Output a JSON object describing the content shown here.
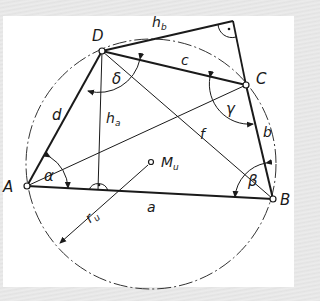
{
  "figure": {
    "colors": {
      "line": "#1a1a1a",
      "background": "#ffffff",
      "frame": "#e6e6e6"
    },
    "vertices": [
      {
        "id": "A",
        "label": "A"
      },
      {
        "id": "B",
        "label": "B"
      },
      {
        "id": "C",
        "label": "C"
      },
      {
        "id": "D",
        "label": "D"
      }
    ],
    "sides": {
      "a": "a",
      "b": "b",
      "c": "c",
      "d": "d"
    },
    "diagonals": {
      "e": "",
      "f": "f"
    },
    "heights": {
      "ha": "h",
      "ha_sub": "a",
      "hb": "h",
      "hb_sub": "b"
    },
    "angles": {
      "alpha": "α",
      "beta": "β",
      "gamma": "γ",
      "delta": "δ"
    },
    "circle": {
      "center": "M",
      "center_sub": "u",
      "radius": "r",
      "radius_sub": "u"
    },
    "right_angle_mark": "·"
  }
}
